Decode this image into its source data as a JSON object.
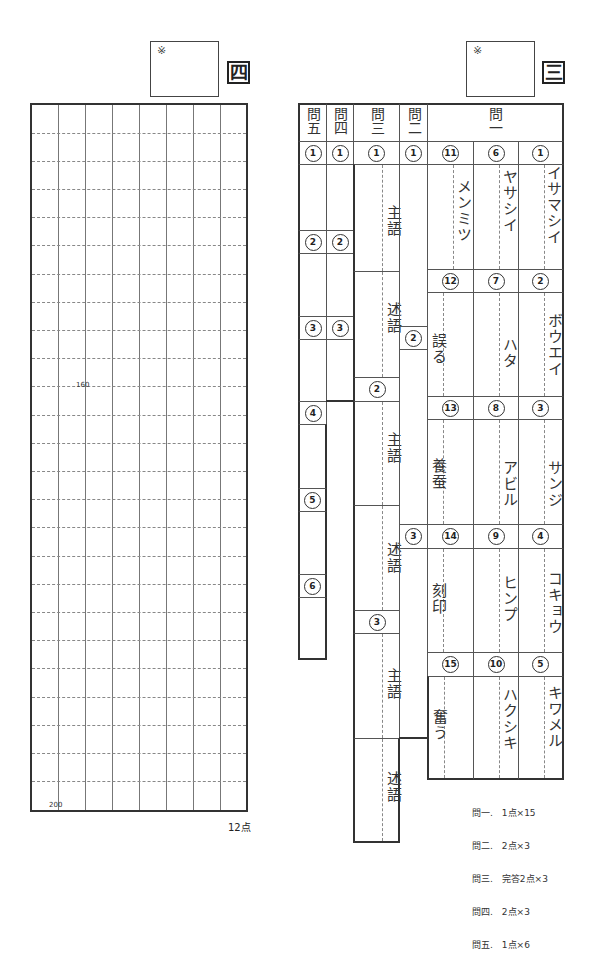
{
  "section4": {
    "label": "四",
    "score_mark": "※",
    "grid": {
      "columns": 8,
      "rows": 25
    },
    "counter_labels": [
      "160",
      "200"
    ],
    "points": "12点"
  },
  "section3": {
    "label": "三",
    "score_mark": "※",
    "headers": {
      "q5": "問五",
      "q4": "問四",
      "q3": "問三",
      "q2": "問二",
      "q1": "問一"
    },
    "q1": {
      "items": [
        {
          "num": "1",
          "answer": "イサマシイ"
        },
        {
          "num": "2",
          "answer": "ボウエイ"
        },
        {
          "num": "3",
          "answer": "サンジ"
        },
        {
          "num": "4",
          "answer": "コキョウ"
        },
        {
          "num": "5",
          "answer": "キワメル"
        },
        {
          "num": "6",
          "answer": "ヤサシイ"
        },
        {
          "num": "7",
          "answer": "ハタ"
        },
        {
          "num": "8",
          "answer": "アビル"
        },
        {
          "num": "9",
          "answer": "ヒンプ"
        },
        {
          "num": "10",
          "answer": "ハクシキ"
        },
        {
          "num": "11",
          "answer": "メンミツ"
        },
        {
          "num": "12",
          "answer": "誤る"
        },
        {
          "num": "13",
          "answer": "養蚕"
        },
        {
          "num": "14",
          "answer": "刻印"
        },
        {
          "num": "15",
          "answer": "奮う"
        }
      ]
    },
    "q2": {
      "nums": [
        "1",
        "2",
        "3"
      ]
    },
    "q3": {
      "nums": [
        "1",
        "2",
        "3"
      ],
      "subject": "主語",
      "predicate": "述語"
    },
    "q4": {
      "nums": [
        "1",
        "2",
        "3"
      ]
    },
    "q5": {
      "nums": [
        "1",
        "2",
        "3",
        "4",
        "5",
        "6"
      ]
    },
    "scoring": [
      "問一.　1点×15",
      "問二.　2点×3",
      "問三.　完答2点×3",
      "問四.　2点×3",
      "問五.　1点×6"
    ]
  }
}
